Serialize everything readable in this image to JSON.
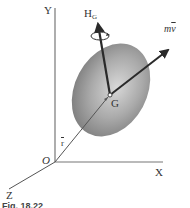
{
  "figure": {
    "axes": {
      "y_label": "Y",
      "x_label": "X",
      "z_label": "Z",
      "origin_label": "O"
    },
    "points": {
      "center_label": "G"
    },
    "vectors": {
      "position": {
        "label": "r"
      },
      "angular_momentum": {
        "label_main": "H",
        "label_sub": "G"
      },
      "linear_momentum": {
        "label_m": "m",
        "label_v": "v"
      }
    },
    "caption": "Fig. 18.22",
    "colors": {
      "body_fill": "#9a9a9a",
      "axis": "#777777",
      "vector": "#2a2a2a",
      "background": "#ffffff"
    }
  }
}
